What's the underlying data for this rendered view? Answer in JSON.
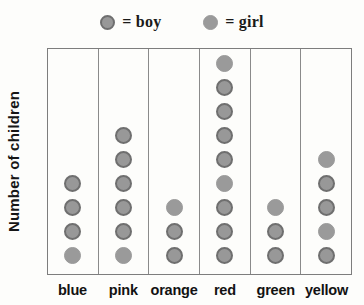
{
  "legend": {
    "entries": [
      {
        "icon": "boy-dot-icon",
        "marker": "boy",
        "label": "= boy"
      },
      {
        "icon": "girl-dot-icon",
        "marker": "girl",
        "label": "= girl"
      }
    ]
  },
  "axes": {
    "ylabel": "Number of children",
    "xlabel": ""
  },
  "chart_data": {
    "type": "bar",
    "title": "",
    "subtitle": "",
    "xlabel": "",
    "ylabel": "Number of children",
    "categories": [
      "blue",
      "pink",
      "orange",
      "red",
      "green",
      "yellow"
    ],
    "values": [
      4,
      6,
      3,
      9,
      3,
      5
    ],
    "series": [
      {
        "name": "Number of children",
        "values": [
          4,
          6,
          3,
          9,
          3,
          5
        ]
      }
    ],
    "unit": "1 dot = 1 child",
    "ylim": [
      0,
      9
    ],
    "grid": false,
    "legend_position": "top",
    "legend_entries": [
      "= boy",
      "= girl"
    ],
    "markers": {
      "blue": [
        "girl",
        "boy",
        "boy",
        "boy"
      ],
      "pink": [
        "girl",
        "boy",
        "boy",
        "boy",
        "boy",
        "boy"
      ],
      "orange": [
        "boy",
        "boy",
        "girl"
      ],
      "red": [
        "boy",
        "boy",
        "boy",
        "girl",
        "boy",
        "boy",
        "boy",
        "boy",
        "girl"
      ],
      "green": [
        "boy",
        "boy",
        "girl"
      ],
      "yellow": [
        "boy",
        "girl",
        "boy",
        "boy",
        "girl"
      ]
    }
  }
}
